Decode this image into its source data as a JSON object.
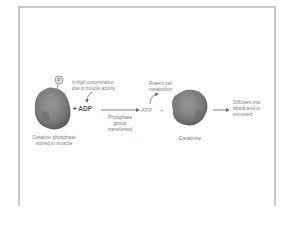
{
  "diagram": {
    "type": "reaction-pathway",
    "colors": {
      "frame": "#c8c8c8",
      "molecule": "#7d7d7d",
      "molecule_dark": "#5e5e5e",
      "arrow": "#666666",
      "text": "#7a7a7a"
    },
    "nodes": {
      "phosphate": {
        "symbol": "P",
        "icon": "phosphate-circle-icon"
      },
      "creatine_phosphate": {
        "label_line1": "Creatine phosphate",
        "label_line2": "stored in muscle",
        "icon": "creatine-phosphate-molecule-icon"
      },
      "adp": {
        "label": "+ ADP"
      },
      "adp_note": {
        "line1": "In high concentration",
        "line2": "due to muscle activity"
      },
      "transfer": {
        "line1": "Phosphate",
        "line2": "group",
        "line3": "transferred"
      },
      "atp": {
        "label": "ATP",
        "plus": "+"
      },
      "atp_note": {
        "line1": "Powers cell",
        "line2": "metabolism"
      },
      "creatinine": {
        "label": "Creatinine",
        "icon": "creatinine-molecule-icon"
      },
      "excretion": {
        "line1": "Diffuses into",
        "line2": "blood and is",
        "line3": "excreted"
      }
    }
  }
}
